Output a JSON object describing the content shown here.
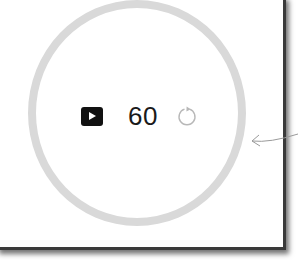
{
  "timer": {
    "value": "60",
    "play_icon": "play-icon",
    "reset_icon": "reset-icon"
  },
  "ring": {
    "color": "#d9d9d9"
  },
  "annotation": {
    "arrow_icon": "arrow-left-icon"
  }
}
